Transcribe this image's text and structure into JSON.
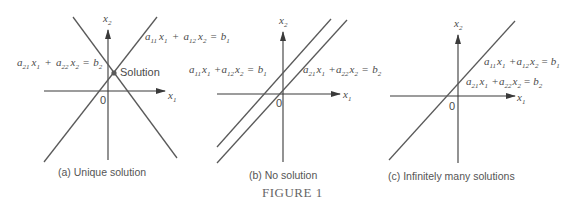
{
  "figure_title": "FIGURE 1",
  "panels": [
    {
      "id": "a",
      "caption": "(a)  Unique solution",
      "axis_x_label": "x",
      "axis_x_sub": "1",
      "axis_y_label": "x",
      "axis_y_sub": "2",
      "origin_label": "0",
      "point_label": "Solution",
      "equations": [
        {
          "a1": "a",
          "a1s": "11",
          "x1": "x",
          "x1s": "1",
          "op": "+",
          "a2": "a",
          "a2s": "12",
          "x2": "x",
          "x2s": "2",
          "eq": "=",
          "b": "b",
          "bs": "1"
        },
        {
          "a1": "a",
          "a1s": "21",
          "x1": "x",
          "x1s": "1",
          "op": "+",
          "a2": "a",
          "a2s": "22",
          "x2": "x",
          "x2s": "2",
          "eq": "=",
          "b": "b",
          "bs": "2"
        }
      ]
    },
    {
      "id": "b",
      "caption": "(b)  No solution",
      "axis_x_label": "x",
      "axis_x_sub": "1",
      "axis_y_label": "x",
      "axis_y_sub": "2",
      "origin_label": "0",
      "equations": [
        {
          "a1": "a",
          "a1s": "11",
          "x1": "x",
          "x1s": "1",
          "op": "+",
          "a2": "a",
          "a2s": "12",
          "x2": "x",
          "x2s": "2",
          "eq": "=",
          "b": "b",
          "bs": "1"
        },
        {
          "a1": "a",
          "a1s": "21",
          "x1": "x",
          "x1s": "1",
          "op": "+",
          "a2": "a",
          "a2s": "22",
          "x2": "x",
          "x2s": "2",
          "eq": "=",
          "b": "b",
          "bs": "2"
        }
      ]
    },
    {
      "id": "c",
      "caption": "(c)  Infinitely many solutions",
      "axis_x_label": "x",
      "axis_x_sub": "1",
      "axis_y_label": "x",
      "axis_y_sub": "2",
      "origin_label": "0",
      "equations": [
        {
          "a1": "a",
          "a1s": "11",
          "x1": "x",
          "x1s": "1",
          "op": "+",
          "a2": "a",
          "a2s": "12",
          "x2": "x",
          "x2s": "2",
          "eq": "=",
          "b": "b",
          "bs": "1"
        },
        {
          "a1": "a",
          "a1s": "21",
          "x1": "x",
          "x1s": "1",
          "op": "+",
          "a2": "a",
          "a2s": "22",
          "x2": "x",
          "x2s": "2",
          "eq": "=",
          "b": "b",
          "bs": "2"
        }
      ]
    }
  ]
}
